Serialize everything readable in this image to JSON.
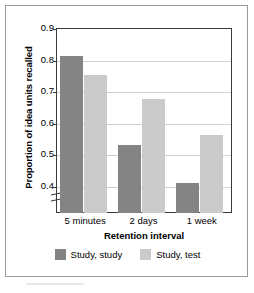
{
  "chart_data": {
    "type": "bar",
    "title": "",
    "xlabel": "Retention interval",
    "ylabel": "Proportion of idea units recalled",
    "categories": [
      "5 minutes",
      "2 days",
      "1 week"
    ],
    "series": [
      {
        "name": "Study, study",
        "color": "#848484",
        "values": [
          0.81,
          0.53,
          0.41
        ]
      },
      {
        "name": "Study, test",
        "color": "#cbcbcb",
        "values": [
          0.75,
          0.675,
          0.56
        ]
      }
    ],
    "ylim": [
      0.4,
      0.9
    ],
    "ytick_labels": [
      "0.9",
      "0.8",
      "0.7",
      "0.6",
      "0.5",
      "0.4"
    ],
    "ytick_values": [
      0.9,
      0.8,
      0.7,
      0.6,
      0.5,
      0.4
    ],
    "axis_break": true,
    "grid": "horizontal",
    "legend_position": "bottom"
  },
  "axes": {
    "y_title": "Proportion of idea units recalled",
    "x_title": "Retention interval"
  },
  "legend": {
    "items": [
      {
        "label": "Study, study",
        "color": "#848484"
      },
      {
        "label": "Study, test",
        "color": "#cbcbcb"
      }
    ]
  },
  "colors": {
    "series_dark": "#848484",
    "series_light": "#cbcbcb",
    "axis": "#3a3a3a",
    "grid": "#d0d0d0",
    "frame": "#9a9a9a",
    "background": "#ffffff"
  }
}
